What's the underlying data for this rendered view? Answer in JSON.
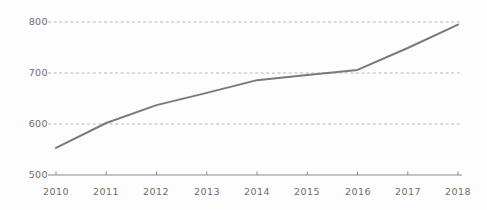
{
  "chart_data": {
    "type": "line",
    "title": "",
    "subtitle": "",
    "xlabel": "",
    "ylabel": "",
    "categories": [
      "2010",
      "2011",
      "2012",
      "2013",
      "2014",
      "2015",
      "2016",
      "2017",
      "2018"
    ],
    "x": [
      2010,
      2011,
      2012,
      2013,
      2014,
      2015,
      2016,
      2017,
      2018
    ],
    "values": [
      553,
      602,
      637,
      661,
      686,
      696,
      706,
      749,
      795
    ],
    "series": [
      {
        "name": "",
        "values": [
          553,
          602,
          637,
          661,
          686,
          696,
          706,
          749,
          795
        ]
      }
    ],
    "xlim": [
      2010,
      2018
    ],
    "ylim": [
      500,
      800
    ],
    "y_ticks": [
      500,
      600,
      700,
      800
    ],
    "x_ticks": [
      "2010",
      "2011",
      "2012",
      "2013",
      "2014",
      "2015",
      "2016",
      "2017",
      "2018"
    ],
    "grid": "horizontal-dashed",
    "gridlines_at": [
      600,
      700,
      800
    ],
    "legend": "none",
    "markers": "none",
    "annotations": [],
    "colors": {
      "line": "#7a7a7a",
      "grid": "#b9b9b9",
      "axis": "#8c8c8c",
      "tick_text": "#6d6d6d",
      "background": "#fdfdfd"
    },
    "line_width": 2
  },
  "axes": {
    "y_tick_labels": [
      "800",
      "700",
      "600",
      "500"
    ],
    "x_tick_labels": [
      "2010",
      "2011",
      "2012",
      "2013",
      "2014",
      "2015",
      "2016",
      "2017",
      "2018"
    ]
  }
}
